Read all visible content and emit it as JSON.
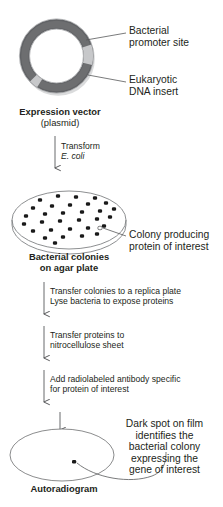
{
  "figure": {
    "colors": {
      "plasmid_backbone": "#6d6e70",
      "plasmid_insert_light": "#c7c8ca",
      "plasmid_shadow": "#54565a",
      "text": "#231f20",
      "line": "#58595b",
      "colony_dot": "#1a1a1a",
      "plate_outline": "#808285",
      "film_outline": "#6d6e70"
    }
  },
  "plasmid": {
    "labels": {
      "promoter": "Bacterial\npromoter site",
      "promoter_line1": "Bacterial",
      "promoter_line2": "promoter site",
      "insert_line1": "Eukaryotic",
      "insert_line2": "DNA insert"
    },
    "caption_bold": "Expression vector",
    "caption_sub": "(plasmid)"
  },
  "steps": [
    {
      "id": "transform",
      "line1": "Transform",
      "line2": "E. coli",
      "line2_italic": true
    },
    {
      "id": "replica-lyse",
      "line1": "Transfer colonies to a replica plate",
      "line2": "Lyse bacteria to expose proteins",
      "line2_italic": false
    },
    {
      "id": "blot",
      "line1": "Transfer proteins to",
      "line2": "nitrocellulose sheet",
      "line2_italic": false
    },
    {
      "id": "antibody",
      "line1": "Add radiolabeled antibody specific",
      "line2": "for protein of interest",
      "line2_italic": false
    }
  ],
  "plate": {
    "callout_line1": "Colony producing",
    "callout_line2": "protein of interest",
    "caption_line1": "Bacterial colonies",
    "caption_line2": "on agar plate",
    "colony_count": 31,
    "colonies": [
      [
        40,
        200
      ],
      [
        58,
        196
      ],
      [
        76,
        197
      ],
      [
        95,
        198
      ],
      [
        33,
        208
      ],
      [
        52,
        206
      ],
      [
        70,
        205
      ],
      [
        88,
        204
      ],
      [
        106,
        203
      ],
      [
        26,
        216
      ],
      [
        45,
        214
      ],
      [
        63,
        213
      ],
      [
        82,
        212
      ],
      [
        100,
        211
      ],
      [
        114,
        209
      ],
      [
        24,
        224
      ],
      [
        42,
        222
      ],
      [
        60,
        221
      ],
      [
        79,
        220
      ],
      [
        97,
        219
      ],
      [
        110,
        217
      ],
      [
        33,
        231
      ],
      [
        51,
        230
      ],
      [
        70,
        229
      ],
      [
        88,
        228
      ],
      [
        104,
        226
      ],
      [
        45,
        238
      ],
      [
        63,
        237
      ],
      [
        82,
        236
      ],
      [
        97,
        234
      ],
      [
        55,
        243
      ]
    ],
    "highlight_colony": [
      100,
      228
    ]
  },
  "autoradiogram": {
    "callout_lines": [
      "Dark spot on film",
      "identifies the",
      "bacterial colony",
      "expressing the",
      "gene of interest"
    ],
    "caption": "Autoradiogram",
    "spot": [
      74,
      462
    ]
  }
}
